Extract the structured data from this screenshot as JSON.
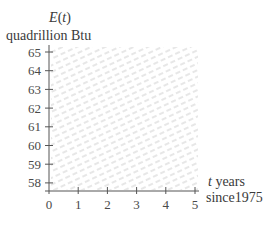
{
  "chart_data": {
    "type": "line",
    "title": "",
    "ylabel_function": "E(t)",
    "ylabel_function_name": "E",
    "ylabel_function_arg": "t",
    "ylabel_unit": "quadrillion Btu",
    "xlabel_var": "t",
    "xlabel_text": " years",
    "xlabel_unit": "since1975",
    "x_ticks": [
      0,
      1,
      2,
      3,
      4,
      5
    ],
    "y_ticks": [
      58,
      59,
      60,
      61,
      62,
      63,
      64,
      65
    ],
    "xlim": [
      0,
      5
    ],
    "ylim": [
      57.5,
      65.5
    ],
    "y_axis_break": true,
    "grid": false,
    "background": "hatched",
    "series": [],
    "colors": {
      "axis": "#555555",
      "hatch": "#d8d8d8",
      "text": "#3a3a3a"
    }
  }
}
